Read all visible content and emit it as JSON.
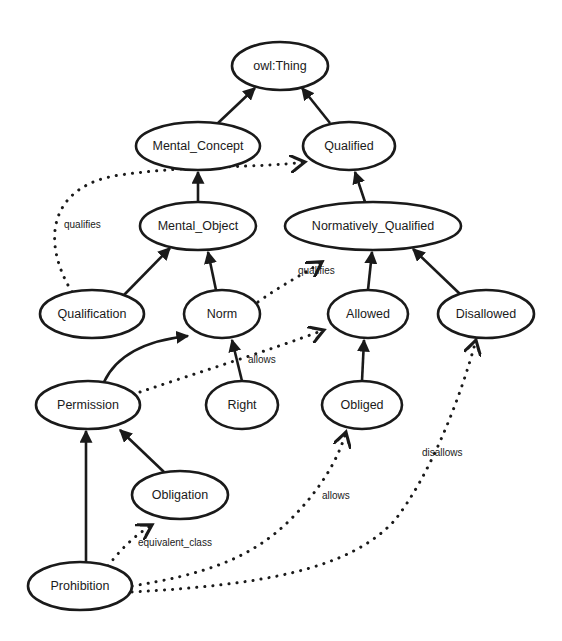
{
  "diagram": {
    "type": "ontology-class-graph",
    "colors": {
      "stroke": "#1a1a1a",
      "fill": "#ffffff",
      "background": "#ffffff"
    },
    "nodes": [
      {
        "id": "owl_thing",
        "label": "owl:Thing",
        "cx": 280,
        "cy": 66,
        "rx": 48,
        "ry": 24
      },
      {
        "id": "mental_concept",
        "label": "Mental_Concept",
        "cx": 198,
        "cy": 146,
        "rx": 62,
        "ry": 24
      },
      {
        "id": "qualified",
        "label": "Qualified",
        "cx": 349,
        "cy": 146,
        "rx": 46,
        "ry": 24
      },
      {
        "id": "mental_object",
        "label": "Mental_Object",
        "cx": 198,
        "cy": 226,
        "rx": 58,
        "ry": 24
      },
      {
        "id": "normatively_qualified",
        "label": "Normatively_Qualified",
        "cx": 373,
        "cy": 226,
        "rx": 88,
        "ry": 24
      },
      {
        "id": "qualification",
        "label": "Qualification",
        "cx": 92,
        "cy": 314,
        "rx": 52,
        "ry": 24
      },
      {
        "id": "norm",
        "label": "Norm",
        "cx": 222,
        "cy": 314,
        "rx": 38,
        "ry": 24
      },
      {
        "id": "allowed",
        "label": "Allowed",
        "cx": 368,
        "cy": 314,
        "rx": 40,
        "ry": 24
      },
      {
        "id": "disallowed",
        "label": "Disallowed",
        "cx": 486,
        "cy": 314,
        "rx": 48,
        "ry": 24
      },
      {
        "id": "permission",
        "label": "Permission",
        "cx": 88,
        "cy": 405,
        "rx": 52,
        "ry": 24
      },
      {
        "id": "right",
        "label": "Right",
        "cx": 242,
        "cy": 405,
        "rx": 36,
        "ry": 24
      },
      {
        "id": "obliged",
        "label": "Obliged",
        "cx": 362,
        "cy": 405,
        "rx": 40,
        "ry": 24
      },
      {
        "id": "obligation",
        "label": "Obligation",
        "cx": 180,
        "cy": 495,
        "rx": 48,
        "ry": 24
      },
      {
        "id": "prohibition",
        "label": "Prohibition",
        "cx": 80,
        "cy": 586,
        "rx": 52,
        "ry": 24
      }
    ],
    "edges": [
      {
        "from": "mental_concept",
        "to": "owl_thing",
        "style": "solid",
        "path": "M218,123 L255,88"
      },
      {
        "from": "qualified",
        "to": "owl_thing",
        "style": "solid",
        "path": "M330,123 L302,88"
      },
      {
        "from": "mental_object",
        "to": "mental_concept",
        "style": "solid",
        "path": "M198,202 L198,172"
      },
      {
        "from": "normatively_qualified",
        "to": "qualified",
        "style": "solid",
        "path": "M365,202 L355,172"
      },
      {
        "from": "qualification",
        "to": "mental_object",
        "style": "solid",
        "path": "M124,295 L170,248"
      },
      {
        "from": "norm",
        "to": "mental_object",
        "style": "solid",
        "path": "M216,290 L208,252"
      },
      {
        "from": "allowed",
        "to": "normatively_qualified",
        "style": "solid",
        "path": "M368,290 L372,252"
      },
      {
        "from": "disallowed",
        "to": "normatively_qualified",
        "style": "solid",
        "path": "M460,294 L413,249"
      },
      {
        "from": "permission",
        "to": "norm",
        "style": "solid",
        "path": "M104,382 C118,352 150,340 188,336"
      },
      {
        "from": "right",
        "to": "norm",
        "style": "solid",
        "path": "M242,381 L232,340"
      },
      {
        "from": "obliged",
        "to": "allowed",
        "style": "solid",
        "path": "M362,381 L364,340"
      },
      {
        "from": "obligation",
        "to": "permission",
        "style": "solid",
        "path": "M164,472 L120,430"
      },
      {
        "from": "prohibition",
        "to": "permission",
        "style": "solid",
        "path": "M86,562 L86,431"
      },
      {
        "from": "qualification",
        "to": "qualified",
        "style": "dotted",
        "label": "qualifies",
        "label_x": 64,
        "label_y": 228,
        "path": "M72,292 C40,240 50,185 120,175 C190,165 260,168 305,162"
      },
      {
        "from": "norm",
        "to": "normatively_qualified",
        "style": "dotted",
        "label": "qualifies",
        "label_x": 298,
        "label_y": 274,
        "path": "M258,302 C280,286 300,276 322,262"
      },
      {
        "from": "permission",
        "to": "allowed",
        "style": "dotted",
        "label": "allows",
        "label_x": 248,
        "label_y": 363,
        "path": "M140,392 C200,372 270,350 324,330"
      },
      {
        "from": "prohibition",
        "to": "obligation",
        "style": "dotted",
        "label": "equivalent_class",
        "label_x": 138,
        "label_y": 546,
        "path": "M108,566 C120,550 135,535 152,525"
      },
      {
        "from": "prohibition",
        "to": "obliged",
        "style": "dotted",
        "label": "allows",
        "label_x": 322,
        "label_y": 499,
        "path": "M132,586 C200,575 250,560 290,520 C320,490 338,460 346,432"
      },
      {
        "from": "prohibition",
        "to": "disallowed",
        "style": "dotted",
        "label": "disallows",
        "label_x": 422,
        "label_y": 456,
        "path": "M132,592 C260,585 350,570 395,520 C430,475 460,400 476,340"
      }
    ]
  }
}
